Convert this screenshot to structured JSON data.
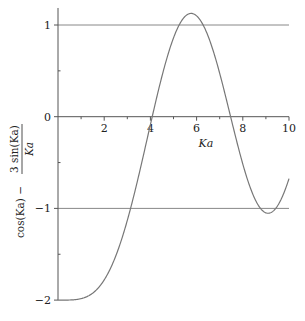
{
  "chart_data": {
    "type": "line",
    "title": "",
    "function": "cos(Ka) - 3 sin(Ka)/Ka",
    "xlabel": "Ka",
    "ylabel": "cos(Ka) − 3 sin(Ka) / Ka",
    "ylabel_parts": {
      "left": "cos(Ka) −",
      "numerator": "3 sin(Ka)",
      "denominator": "Ka"
    },
    "xlim": [
      0,
      10
    ],
    "ylim": [
      -2,
      1.12
    ],
    "x_ticks": [
      2,
      4,
      6,
      8,
      10
    ],
    "x_tick_labels": [
      "2",
      "4",
      "6",
      "8",
      "10"
    ],
    "y_ticks": [
      1,
      0,
      -1,
      -2
    ],
    "y_tick_labels": [
      "1",
      "0",
      "−1",
      "−2"
    ],
    "reference_lines": [
      1,
      -1
    ],
    "grid": false,
    "legend": null,
    "series": [
      {
        "name": "cos(Ka) - 3 sin(Ka)/Ka",
        "x": [
          0,
          1,
          2,
          3,
          4,
          4.1,
          5,
          5.75,
          6,
          7,
          7.4,
          8,
          9,
          9.1,
          10
        ],
        "values": [
          -2.0,
          -1.98,
          -1.78,
          -1.13,
          -0.09,
          0.02,
          0.86,
          1.12,
          1.1,
          0.47,
          0.09,
          -0.52,
          -1.05,
          -1.05,
          -0.66
        ]
      }
    ],
    "colors": {
      "curve": "#777777",
      "axes": "#555555",
      "reference": "#888888"
    }
  }
}
